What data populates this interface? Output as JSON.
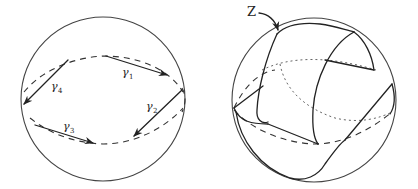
{
  "figure": {
    "left_panel": {
      "description": "Sphere with closed polygonal loop of four arcs",
      "curves": [
        {
          "name": "gamma1",
          "symbol": "γ",
          "subscript": "1"
        },
        {
          "name": "gamma2",
          "symbol": "γ",
          "subscript": "2"
        },
        {
          "name": "gamma3",
          "symbol": "γ",
          "subscript": "3"
        },
        {
          "name": "gamma4",
          "symbol": "γ",
          "subscript": "4"
        }
      ]
    },
    "right_panel": {
      "description": "Sphere with surface Z bounded by the loop",
      "surface_label": "Z"
    },
    "colors": {
      "ink": "#222222",
      "outline": "#444444",
      "background": "#ffffff"
    }
  }
}
